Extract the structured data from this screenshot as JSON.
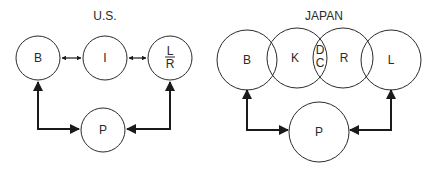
{
  "us": {
    "title": "U.S.",
    "nodes": {
      "b": "B",
      "i": "I",
      "lr_top": "L",
      "lr_bottom": "R",
      "p": "P"
    }
  },
  "japan": {
    "title": "JAPAN",
    "nodes": {
      "b": "B",
      "k": "K",
      "dc_top": "D",
      "dc_bottom": "C",
      "r": "R",
      "l": "L",
      "p": "P"
    }
  }
}
